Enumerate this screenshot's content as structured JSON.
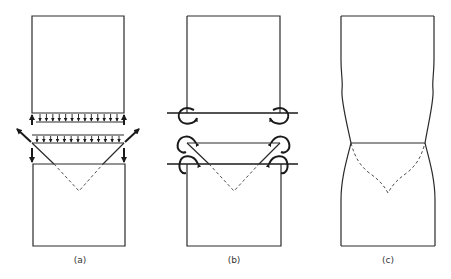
{
  "figure": {
    "panels": [
      {
        "id": "a",
        "label": "(a)",
        "description": "Separated weld/specimen blocks with distributed normal stress arrows and inclined corner forces"
      },
      {
        "id": "b",
        "label": "(b)",
        "description": "Separated blocks with bending moments acting at corners"
      },
      {
        "id": "c",
        "label": "(c)",
        "description": "Deformed specimen with necking and curved fracture profile"
      }
    ],
    "line_color": "#2a2a2a",
    "background": "#ffffff"
  }
}
